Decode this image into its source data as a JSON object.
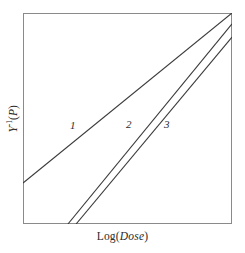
{
  "figure": {
    "background": "#ffffff",
    "frame_color": "#8a8a8a",
    "line_color": "#3a3a3a"
  },
  "axes": {
    "x_title_prefix": "Log(",
    "x_title_italic": "Dose",
    "x_title_suffix": ")",
    "y_title_main": "Y",
    "y_title_exponent": "-1",
    "y_title_arg_open": "(",
    "y_title_arg_italic": "P",
    "y_title_arg_close": ")"
  },
  "curve_labels": [
    {
      "text": "1"
    },
    {
      "text": "2"
    },
    {
      "text": "3"
    }
  ],
  "chart_data": {
    "type": "line",
    "title": "",
    "xlabel": "Log(Dose)",
    "ylabel": "Y^-1(P)",
    "xlim": [
      0,
      1
    ],
    "ylim": [
      0,
      1
    ],
    "grid": false,
    "legend": "inline-labels",
    "axis_ticks": false,
    "series": [
      {
        "name": "1",
        "label": "1",
        "x": [
          0.0,
          1.0
        ],
        "y": [
          0.194,
          1.0
        ],
        "slope_rel": 0.806,
        "label_position": {
          "x": 0.239,
          "y": 0.469
        },
        "clipped_at": "top"
      },
      {
        "name": "2",
        "label": "2",
        "x": [
          0.215,
          1.0
        ],
        "y": [
          0.0,
          0.948
        ],
        "slope_rel": 1.208,
        "label_position": {
          "x": 0.507,
          "y": 0.474
        },
        "clipped_at": "right"
      },
      {
        "name": "3",
        "label": "3",
        "x": [
          0.254,
          1.0
        ],
        "y": [
          0.0,
          0.886
        ],
        "slope_rel": 1.188,
        "label_position": {
          "x": 0.689,
          "y": 0.474
        },
        "clipped_at": "right"
      }
    ]
  }
}
